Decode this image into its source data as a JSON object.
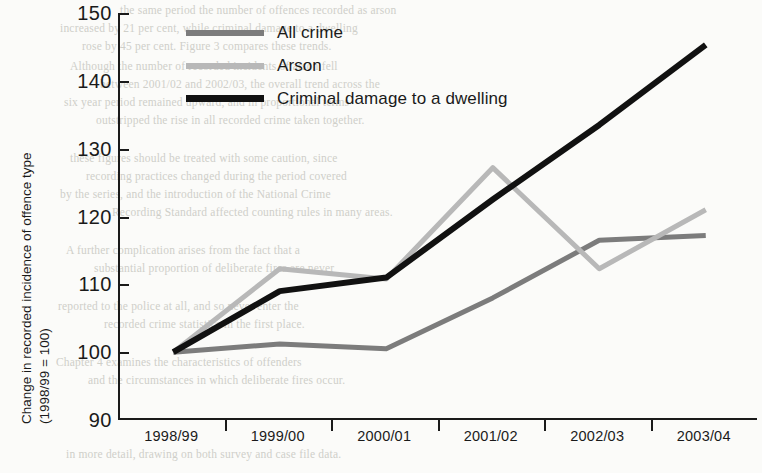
{
  "colors": {
    "all_crime": "#7c7c7c",
    "arson": "#b8b8b8",
    "criminal_damage": "#111111",
    "axis": "#1a1a1a"
  },
  "axis": {
    "y_title_line1": "Change in recorded incidence of offence type",
    "y_title_line2": "(1998/99 = 100)",
    "y_ticks": [
      "150",
      "140",
      "130",
      "120",
      "110",
      "100",
      "90"
    ],
    "x_ticks": [
      "1998/99",
      "1999/00",
      "2000/01",
      "2001/02",
      "2002/03",
      "2003/04"
    ]
  },
  "legend": {
    "items": [
      {
        "label": "All crime",
        "color": "#7c7c7c"
      },
      {
        "label": "Arson",
        "color": "#b8b8b8"
      },
      {
        "label": "Criminal damage to a dwelling",
        "color": "#111111"
      }
    ]
  },
  "background_bleed": [
    {
      "x": 120,
      "y": 4,
      "text": "the same period the number of offences recorded as arson"
    },
    {
      "x": 60,
      "y": 22,
      "text": "increased by 21 per cent, while criminal damage to a dwelling"
    },
    {
      "x": 82,
      "y": 40,
      "text": "rose by 45 per cent. Figure 3 compares these trends."
    },
    {
      "x": 70,
      "y": 60,
      "text": "Although the number of recorded incidents of arson fell"
    },
    {
      "x": 100,
      "y": 78,
      "text": "between 2001/02 and 2002/03, the overall trend across the"
    },
    {
      "x": 64,
      "y": 96,
      "text": "six year period remained upward, and in proportional terms"
    },
    {
      "x": 96,
      "y": 114,
      "text": "outstripped the rise in all recorded crime taken together."
    },
    {
      "x": 70,
      "y": 152,
      "text": "these figures should be treated with some caution, since"
    },
    {
      "x": 86,
      "y": 170,
      "text": "recording practices changed during the period covered"
    },
    {
      "x": 60,
      "y": 188,
      "text": "by the series, and the introduction of the National Crime"
    },
    {
      "x": 112,
      "y": 206,
      "text": "Recording Standard affected counting rules in many areas."
    },
    {
      "x": 66,
      "y": 244,
      "text": "A further complication arises from the fact that a"
    },
    {
      "x": 94,
      "y": 262,
      "text": "substantial proportion of deliberate fires are never"
    },
    {
      "x": 58,
      "y": 300,
      "text": "reported to the police at all, and so never enter the"
    },
    {
      "x": 104,
      "y": 318,
      "text": "recorded crime statistics in the first place."
    },
    {
      "x": 56,
      "y": 356,
      "text": "Chapter 4 examines the characteristics of offenders"
    },
    {
      "x": 88,
      "y": 374,
      "text": "and the circumstances in which deliberate fires occur."
    },
    {
      "x": 66,
      "y": 448,
      "text": "in more detail, drawing on both survey and case file data."
    }
  ],
  "chart_data": {
    "type": "line",
    "title": "",
    "xlabel": "",
    "ylabel": "Change in recorded incidence of offence type (1998/99 = 100)",
    "categories": [
      "1998/99",
      "1999/00",
      "2000/01",
      "2001/02",
      "2002/03",
      "2003/04"
    ],
    "ylim": [
      90,
      150
    ],
    "ytick_step": 10,
    "grid": false,
    "legend_position": "top-left-inside",
    "series": [
      {
        "name": "All crime",
        "color": "#7c7c7c",
        "values": [
          100,
          101.2,
          100.5,
          108,
          116.5,
          117.2
        ]
      },
      {
        "name": "Arson",
        "color": "#b8b8b8",
        "values": [
          100,
          112.3,
          110.8,
          127.2,
          112.3,
          121
        ]
      },
      {
        "name": "Criminal damage to a dwelling",
        "color": "#111111",
        "values": [
          100,
          109,
          111,
          122.5,
          133.5,
          145.3
        ]
      }
    ]
  }
}
